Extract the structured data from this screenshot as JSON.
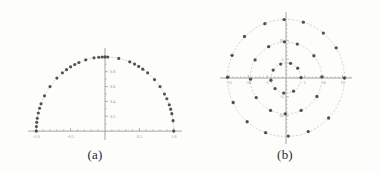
{
  "figure": {
    "background_color": "#fdfdfc",
    "axis_color": "#9a9a9a",
    "point_color": "#3a3a3a",
    "guide_color": "#c9c9c9",
    "tick_label_color": "#8d8d8d"
  },
  "panels": [
    {
      "id": "a",
      "caption": "(a)",
      "chart_index": 0
    },
    {
      "id": "b",
      "caption": "(b)",
      "chart_index": 1
    }
  ],
  "chart_data": [
    {
      "type": "scatter",
      "title": "",
      "subtitle": "",
      "xlabel": "",
      "ylabel": "",
      "xlim": [
        -1.12,
        1.12
      ],
      "ylim": [
        -0.12,
        1.12
      ],
      "grid": false,
      "legend": null,
      "xticks": [
        -1.0,
        -0.5,
        0.5,
        1.0
      ],
      "xticklabels": [
        "-1.0",
        "-0.5",
        "0.5",
        "1.0"
      ],
      "yticks": [
        0.2,
        0.4,
        0.6,
        0.8
      ],
      "yticklabels": [
        "0.2",
        "0.4",
        "0.6",
        "0.8"
      ],
      "minor_xticks": [
        -0.9,
        -0.8,
        -0.7,
        -0.6,
        -0.4,
        -0.3,
        -0.2,
        -0.1,
        0.1,
        0.2,
        0.3,
        0.4,
        0.6,
        0.7,
        0.8,
        0.9
      ],
      "minor_yticks": [
        0.1,
        0.3,
        0.5,
        0.7,
        0.9
      ],
      "guide_curve": {
        "kind": "semicircle",
        "radius": 1.0,
        "center": [
          0,
          0
        ],
        "style": "dotted"
      },
      "points": [
        {
          "x": -1.0,
          "y": 0.0
        },
        {
          "x": -0.998,
          "y": 0.062
        },
        {
          "x": -0.993,
          "y": 0.118
        },
        {
          "x": -0.985,
          "y": 0.174
        },
        {
          "x": -0.97,
          "y": 0.243
        },
        {
          "x": -0.952,
          "y": 0.307
        },
        {
          "x": -0.93,
          "y": 0.368
        },
        {
          "x": -0.88,
          "y": 0.475
        },
        {
          "x": -0.8,
          "y": 0.6
        },
        {
          "x": -0.7,
          "y": 0.714
        },
        {
          "x": -0.62,
          "y": 0.785
        },
        {
          "x": -0.56,
          "y": 0.828
        },
        {
          "x": -0.5,
          "y": 0.866
        },
        {
          "x": -0.44,
          "y": 0.898
        },
        {
          "x": -0.38,
          "y": 0.925
        },
        {
          "x": -0.28,
          "y": 0.96
        },
        {
          "x": -0.16,
          "y": 0.987
        },
        {
          "x": -0.09,
          "y": 0.996
        },
        {
          "x": -0.04,
          "y": 0.999
        },
        {
          "x": 0.0,
          "y": 1.0
        },
        {
          "x": 0.04,
          "y": 0.999
        },
        {
          "x": 0.2,
          "y": 0.98
        },
        {
          "x": 0.36,
          "y": 0.933
        },
        {
          "x": 0.43,
          "y": 0.903
        },
        {
          "x": 0.49,
          "y": 0.872
        },
        {
          "x": 0.55,
          "y": 0.835
        },
        {
          "x": 0.62,
          "y": 0.785
        },
        {
          "x": 0.72,
          "y": 0.694
        },
        {
          "x": 0.8,
          "y": 0.6
        },
        {
          "x": 0.865,
          "y": 0.5
        },
        {
          "x": 0.9,
          "y": 0.436
        },
        {
          "x": 0.935,
          "y": 0.355
        },
        {
          "x": 0.955,
          "y": 0.296
        },
        {
          "x": 0.972,
          "y": 0.235
        },
        {
          "x": 0.99,
          "y": 0.141
        },
        {
          "x": 1.0,
          "y": 0.0
        }
      ]
    },
    {
      "type": "scatter",
      "title": "",
      "subtitle": "",
      "xlabel": "",
      "ylabel": "",
      "xlim": [
        -17.5,
        17.5
      ],
      "ylim": [
        -17.5,
        17.5
      ],
      "grid": false,
      "legend": null,
      "xticks": [
        -15,
        -10,
        -5,
        5,
        10,
        15
      ],
      "xticklabels": [
        "-15",
        "-10",
        "-5",
        "5",
        "10",
        "15"
      ],
      "yticks": [
        -10,
        -5,
        5,
        10
      ],
      "yticklabels": [
        "-10",
        "-5",
        "5",
        "10"
      ],
      "minor_xticks": [
        -14,
        -13,
        -12,
        -11,
        -9,
        -8,
        -7,
        -6,
        -4,
        -3,
        -2,
        -1,
        1,
        2,
        3,
        4,
        6,
        7,
        8,
        9,
        11,
        12,
        13,
        14,
        16,
        17
      ],
      "minor_yticks": [
        -14,
        -13,
        -12,
        -11,
        -9,
        -8,
        -7,
        -6,
        -4,
        -3,
        -2,
        -1,
        1,
        2,
        3,
        4,
        6,
        7,
        8,
        9,
        11,
        12,
        13,
        14
      ],
      "guide_circles": [
        {
          "radius": 4.0,
          "style": "dotted"
        },
        {
          "radius": 9.5,
          "style": "dotted"
        },
        {
          "radius": 15.5,
          "style": "dotted"
        }
      ],
      "points": [
        {
          "x": 15.5,
          "y": 0.0
        },
        {
          "x": 13.3,
          "y": 8.0
        },
        {
          "x": 9.9,
          "y": 11.9
        },
        {
          "x": 4.6,
          "y": 14.8
        },
        {
          "x": -0.5,
          "y": 15.5
        },
        {
          "x": -5.6,
          "y": 14.4
        },
        {
          "x": -11.0,
          "y": 11.0
        },
        {
          "x": -14.3,
          "y": 6.0
        },
        {
          "x": -15.5,
          "y": 0.2
        },
        {
          "x": -14.0,
          "y": -6.5
        },
        {
          "x": -10.3,
          "y": -11.6
        },
        {
          "x": -5.4,
          "y": -14.5
        },
        {
          "x": 0.6,
          "y": -15.4
        },
        {
          "x": 5.9,
          "y": -14.2
        },
        {
          "x": 11.3,
          "y": -10.6
        },
        {
          "x": 9.5,
          "y": 0.3
        },
        {
          "x": 7.4,
          "y": 5.9
        },
        {
          "x": 3.0,
          "y": 9.0
        },
        {
          "x": -0.4,
          "y": 9.6
        },
        {
          "x": -4.6,
          "y": 8.3
        },
        {
          "x": -8.2,
          "y": 4.8
        },
        {
          "x": -9.4,
          "y": -0.3
        },
        {
          "x": -7.9,
          "y": -5.2
        },
        {
          "x": -4.1,
          "y": -8.6
        },
        {
          "x": -0.2,
          "y": -9.5
        },
        {
          "x": 4.0,
          "y": -8.6
        },
        {
          "x": 8.2,
          "y": -4.9
        },
        {
          "x": 4.0,
          "y": 0.1
        },
        {
          "x": 3.1,
          "y": 2.6
        },
        {
          "x": 1.2,
          "y": 3.9
        },
        {
          "x": -1.4,
          "y": 3.7
        },
        {
          "x": -3.4,
          "y": 2.1
        },
        {
          "x": -4.0,
          "y": -0.6
        },
        {
          "x": -2.9,
          "y": -2.8
        },
        {
          "x": -0.6,
          "y": -4.0
        },
        {
          "x": 2.0,
          "y": -3.5
        }
      ]
    }
  ]
}
